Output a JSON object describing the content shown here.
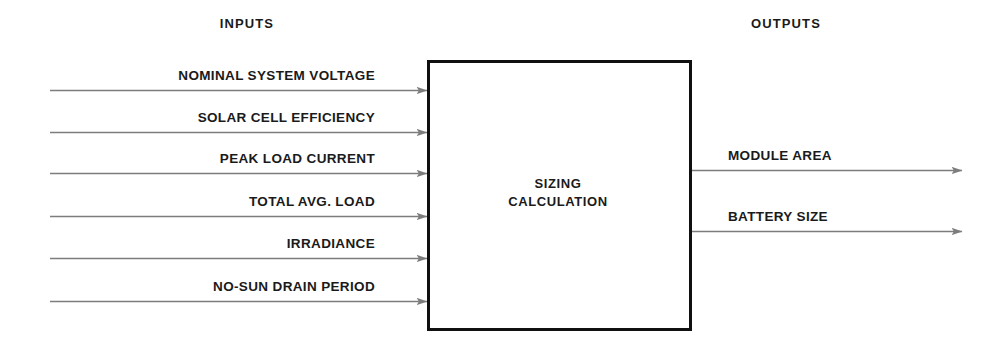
{
  "diagram": {
    "type": "block-flow-diagram",
    "title": "Sizing Calculation",
    "background_color": "#ffffff",
    "arrow_color": "#7d7d7d",
    "box_border_color": "#101010",
    "text_color": "#1a1a1a"
  },
  "headers": {
    "inputs": "INPUTS",
    "outputs": "OUTPUTS"
  },
  "process_box": {
    "line1": "SIZING",
    "line2": "CALCULATION"
  },
  "inputs": [
    {
      "label": "NOMINAL SYSTEM VOLTAGE"
    },
    {
      "label": "SOLAR CELL EFFICIENCY"
    },
    {
      "label": "PEAK LOAD CURRENT"
    },
    {
      "label": "TOTAL AVG. LOAD"
    },
    {
      "label": "IRRADIANCE"
    },
    {
      "label": "NO-SUN DRAIN PERIOD"
    }
  ],
  "outputs": [
    {
      "label": "MODULE AREA"
    },
    {
      "label": "BATTERY SIZE"
    }
  ]
}
